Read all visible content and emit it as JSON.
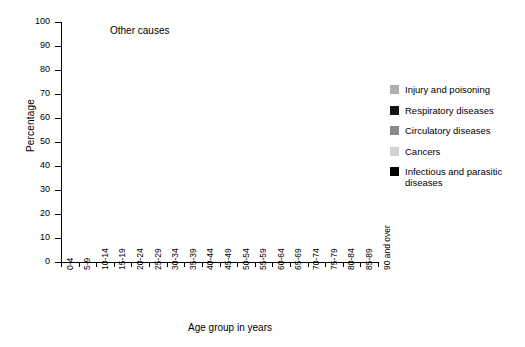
{
  "chart_data": {
    "type": "area",
    "stacked": true,
    "title": "",
    "xlabel": "Age group in years",
    "ylabel": "Percentage",
    "ylim": [
      0,
      100
    ],
    "ytick_step": 10,
    "yticks": [
      0,
      10,
      20,
      30,
      40,
      50,
      60,
      70,
      80,
      90,
      100
    ],
    "grid": false,
    "legend_position": "right",
    "annotations": [
      {
        "text": "Other causes",
        "x_category": "15-19",
        "y": 95
      }
    ],
    "categories": [
      "0-4",
      "5-9",
      "10-14",
      "15-19",
      "20-24",
      "25-29",
      "30-34",
      "35-39",
      "40-44",
      "45-49",
      "50-54",
      "55-59",
      "60-64",
      "65-69",
      "70-74",
      "75-79",
      "80-84",
      "85-89",
      "90 and over"
    ],
    "stack_order_bottom_to_top": [
      "Infectious and parasitic diseases",
      "Cancers",
      "Circulatory diseases",
      "Respiratory diseases",
      "Injury and poisoning",
      "Other causes"
    ],
    "series": [
      {
        "name": "Infectious and parasitic diseases",
        "color": "#000000",
        "values": [
          2.5,
          5.0,
          3.0,
          2.5,
          2.0,
          1.5,
          2.0,
          2.0,
          1.5,
          1.5,
          1.5,
          1.5,
          1.0,
          1.0,
          1.0,
          1.0,
          1.0,
          1.0,
          1.0
        ]
      },
      {
        "name": "Cancers",
        "color": "#d4d4d4",
        "values": [
          6.0,
          22.0,
          22.0,
          11.5,
          9.5,
          12.5,
          18.5,
          24.5,
          31.5,
          38.5,
          43.0,
          45.5,
          46.0,
          43.5,
          38.0,
          30.5,
          22.5,
          15.0,
          9.0
        ]
      },
      {
        "name": "Circulatory diseases",
        "color": "#8a8a8a",
        "values": [
          1.0,
          8.0,
          3.5,
          2.5,
          3.5,
          5.0,
          7.5,
          9.5,
          12.5,
          16.5,
          20.0,
          22.5,
          25.5,
          29.0,
          33.0,
          37.0,
          40.0,
          42.0,
          43.0
        ]
      },
      {
        "name": "Respiratory diseases",
        "color": "#141414",
        "values": [
          1.0,
          8.5,
          3.5,
          1.5,
          2.0,
          2.0,
          2.0,
          2.5,
          3.0,
          3.5,
          4.5,
          5.5,
          7.0,
          8.5,
          10.0,
          12.0,
          14.5,
          17.0,
          19.0
        ]
      },
      {
        "name": "Injury and poisoning",
        "color": "#b0b0b0",
        "values": [
          53.5,
          33.5,
          45.0,
          59.0,
          60.0,
          53.0,
          43.0,
          34.0,
          26.0,
          20.0,
          15.5,
          12.0,
          7.5,
          5.0,
          3.0,
          2.0,
          1.5,
          1.0,
          1.0
        ]
      },
      {
        "name": "Other causes",
        "color": "#ffffff",
        "values": [
          36.0,
          23.0,
          23.0,
          23.0,
          23.0,
          26.0,
          27.0,
          27.5,
          25.5,
          20.0,
          15.5,
          13.0,
          13.0,
          13.0,
          15.0,
          17.5,
          20.5,
          24.0,
          27.0
        ]
      }
    ]
  },
  "axes": {
    "y_title": "Percentage",
    "x_title": "Age group in years",
    "y_tick_labels": [
      "0",
      "10",
      "20",
      "30",
      "40",
      "50",
      "60",
      "70",
      "80",
      "90",
      "100"
    ],
    "x_tick_labels": [
      "0-4",
      "5-9",
      "10-14",
      "15-19",
      "20-24",
      "25-29",
      "30-34",
      "35-39",
      "40-44",
      "45-49",
      "50-54",
      "55-59",
      "60-64",
      "65-69",
      "70-74",
      "75-79",
      "80-84",
      "85-89",
      "90 and over"
    ]
  },
  "plot_annotation": {
    "other_causes": "Other causes"
  },
  "legend": {
    "items": [
      {
        "label": "Injury and poisoning",
        "color": "#b0b0b0"
      },
      {
        "label": "Respiratory diseases",
        "color": "#141414"
      },
      {
        "label": "Circulatory diseases",
        "color": "#8a8a8a"
      },
      {
        "label": "Cancers",
        "color": "#d4d4d4"
      },
      {
        "label": "Infectious and parasitic diseases",
        "color": "#000000"
      }
    ]
  }
}
